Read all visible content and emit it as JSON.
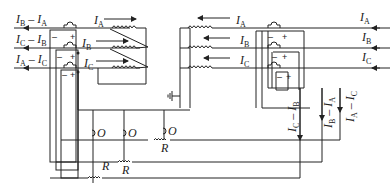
{
  "diagram": {
    "type": "three-phase current transformer differential protection wiring",
    "left_output_labels": [
      {
        "main": "I",
        "sub1": "B",
        "mid": " – I",
        "sub2": "A"
      },
      {
        "main": "I",
        "sub1": "C",
        "mid": " – I",
        "sub2": "B"
      },
      {
        "main": "I",
        "sub1": "A",
        "mid": " – I",
        "sub2": "C"
      }
    ],
    "left_ct_labels": [
      {
        "main": "I",
        "sub": "A"
      },
      {
        "main": "I",
        "sub": "B"
      },
      {
        "main": "I",
        "sub": "C"
      }
    ],
    "right_ct_labels": [
      {
        "main": "I",
        "sub": "A"
      },
      {
        "main": "I",
        "sub": "B"
      },
      {
        "main": "I",
        "sub": "C"
      }
    ],
    "right_input_labels": [
      {
        "main": "I",
        "sub": "A"
      },
      {
        "main": "I",
        "sub": "B"
      },
      {
        "main": "I",
        "sub": "C"
      }
    ],
    "right_vertical_labels": [
      {
        "text": "I_C – I_B"
      },
      {
        "text": "I_B – I_A"
      },
      {
        "text": "I_A – I_C"
      }
    ],
    "polarity": {
      "minus": "–",
      "plus": "+"
    },
    "operating_coil_label": "O",
    "restraint_coil_label": "R",
    "ground_symbol": "ground-icon"
  }
}
